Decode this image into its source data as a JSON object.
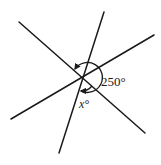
{
  "diagram": {
    "lines": [
      {
        "name": "line-a",
        "direction": "upper-left to lower-right"
      },
      {
        "name": "line-b",
        "direction": "lower-left to upper-right"
      },
      {
        "name": "line-c",
        "direction": "bottom to top (steep)"
      }
    ],
    "angles": [
      {
        "name": "reflex-angle",
        "label": "250°",
        "value_degrees": 250
      },
      {
        "name": "unknown-angle",
        "label": "x°",
        "variable": "x"
      }
    ],
    "colors": {
      "stroke": "#1a1a1a",
      "background": "#ffffff"
    }
  }
}
